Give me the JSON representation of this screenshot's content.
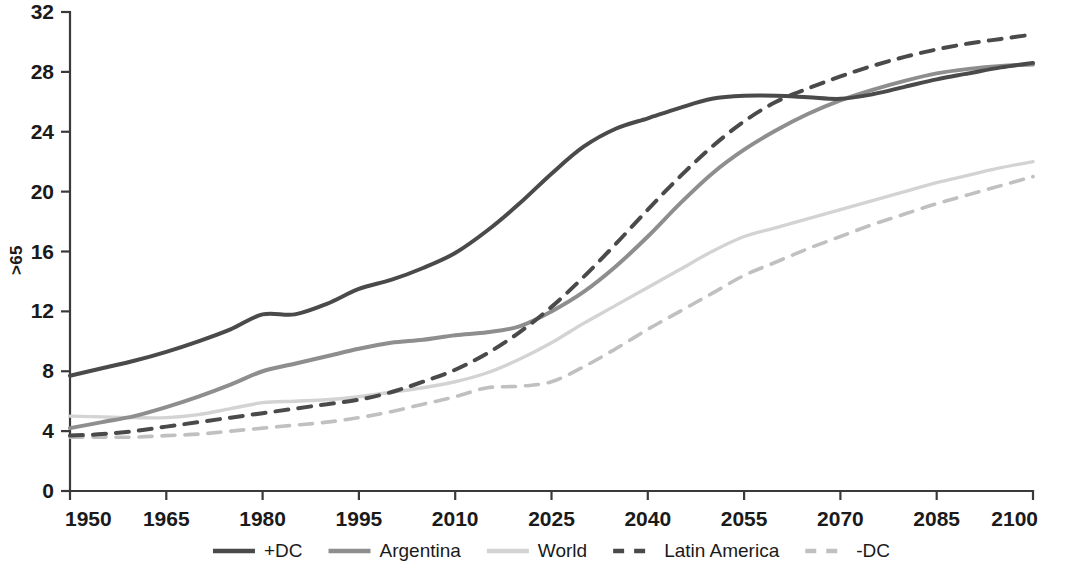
{
  "chart_data": {
    "type": "line",
    "title": "",
    "subtitle": "",
    "xlabel": "",
    "ylabel": ">65",
    "xlim": [
      1950,
      2100
    ],
    "ylim": [
      0,
      32
    ],
    "grid": false,
    "legend_position": "bottom",
    "x_ticks": [
      "1950",
      "1965",
      "1980",
      "1995",
      "2010",
      "2025",
      "2040",
      "2055",
      "2070",
      "2085",
      "2100"
    ],
    "x_tick_values": [
      1950,
      1965,
      1980,
      1995,
      2010,
      2025,
      2040,
      2055,
      2070,
      2085,
      2100
    ],
    "y_ticks": [
      "0",
      "4",
      "8",
      "12",
      "16",
      "20",
      "24",
      "28",
      "32"
    ],
    "y_tick_values": [
      0,
      4,
      8,
      12,
      16,
      20,
      24,
      28,
      32
    ],
    "x": [
      1950,
      1955,
      1960,
      1965,
      1970,
      1975,
      1980,
      1985,
      1990,
      1995,
      2000,
      2005,
      2010,
      2015,
      2020,
      2025,
      2030,
      2035,
      2040,
      2045,
      2050,
      2055,
      2060,
      2065,
      2070,
      2075,
      2080,
      2085,
      2090,
      2095,
      2100
    ],
    "series": [
      {
        "name": "+DC",
        "color": "#4a4a4a",
        "style": "solid",
        "width": 4.0,
        "values": [
          7.7,
          8.2,
          8.7,
          9.3,
          10.0,
          10.8,
          11.8,
          11.8,
          12.5,
          13.5,
          14.1,
          14.9,
          15.9,
          17.4,
          19.2,
          21.2,
          23.0,
          24.2,
          24.9,
          25.6,
          26.2,
          26.4,
          26.4,
          26.3,
          26.2,
          26.5,
          27.0,
          27.5,
          27.9,
          28.3,
          28.6
        ]
      },
      {
        "name": "Argentina",
        "color": "#8e8e8e",
        "style": "solid",
        "width": 4.0,
        "values": [
          4.2,
          4.6,
          5.0,
          5.6,
          6.3,
          7.1,
          8.0,
          8.5,
          9.0,
          9.5,
          9.9,
          10.1,
          10.4,
          10.6,
          11.0,
          12.0,
          13.3,
          15.0,
          17.0,
          19.2,
          21.2,
          22.8,
          24.1,
          25.2,
          26.1,
          26.8,
          27.4,
          27.9,
          28.2,
          28.4,
          28.5
        ]
      },
      {
        "name": "World",
        "color": "#d3d3d3",
        "style": "solid",
        "width": 3.4,
        "values": [
          5.0,
          4.95,
          4.9,
          4.9,
          5.1,
          5.5,
          5.9,
          6.0,
          6.1,
          6.3,
          6.6,
          6.9,
          7.3,
          7.9,
          8.8,
          9.9,
          11.2,
          12.4,
          13.6,
          14.8,
          16.0,
          17.0,
          17.6,
          18.2,
          18.8,
          19.4,
          20.0,
          20.6,
          21.1,
          21.6,
          22.0
        ]
      },
      {
        "name": "Latin America",
        "color": "#4a4a4a",
        "style": "dashed",
        "width": 4.0,
        "dash": "13,10",
        "values": [
          3.7,
          3.8,
          4.0,
          4.3,
          4.6,
          4.9,
          5.2,
          5.5,
          5.8,
          6.1,
          6.6,
          7.3,
          8.1,
          9.2,
          10.6,
          12.3,
          14.3,
          16.5,
          18.8,
          21.0,
          23.0,
          24.7,
          26.0,
          26.9,
          27.7,
          28.4,
          29.0,
          29.5,
          29.9,
          30.2,
          30.5
        ]
      },
      {
        "name": "-DC",
        "color": "#c0c0c0",
        "style": "dashed",
        "width": 3.6,
        "dash": "13,10",
        "values": [
          3.6,
          3.6,
          3.6,
          3.7,
          3.8,
          4.0,
          4.2,
          4.4,
          4.6,
          4.9,
          5.3,
          5.8,
          6.3,
          6.9,
          7.0,
          7.3,
          8.3,
          9.5,
          10.8,
          12.0,
          13.2,
          14.4,
          15.3,
          16.2,
          17.0,
          17.8,
          18.5,
          19.2,
          19.8,
          20.4,
          21.0
        ]
      }
    ],
    "legend": [
      {
        "label": "+DC",
        "color": "#4a4a4a",
        "style": "solid"
      },
      {
        "label": "Argentina",
        "color": "#8e8e8e",
        "style": "solid"
      },
      {
        "label": "World",
        "color": "#d3d3d3",
        "style": "solid"
      },
      {
        "label": "Latin America",
        "color": "#4a4a4a",
        "style": "dashed"
      },
      {
        "label": "-DC",
        "color": "#c0c0c0",
        "style": "dashed"
      }
    ]
  },
  "axis": {
    "y_title": ">65"
  }
}
